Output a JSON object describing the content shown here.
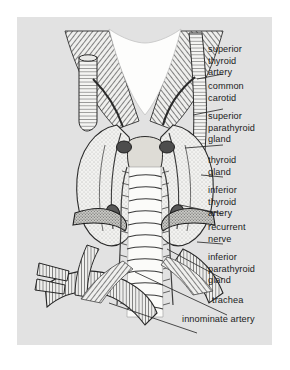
{
  "figure": {
    "kind": "anatomical-illustration",
    "style": "engraving with hatching and stipple shading",
    "panel_color": "#e2e2e2",
    "ink_color": "#1b1b1b",
    "page_background": "#ffffff"
  },
  "labels": [
    {
      "id": "superior-thyroid-artery",
      "lines": [
        "superior",
        "thyroid",
        "artery"
      ],
      "x": 208,
      "y": 44,
      "leader": [
        [
          206,
          57
        ],
        [
          180,
          62
        ]
      ]
    },
    {
      "id": "common-carotid",
      "lines": [
        "common",
        "carotid"
      ],
      "x": 208,
      "y": 81,
      "leader": [
        [
          206,
          92
        ],
        [
          176,
          98
        ]
      ]
    },
    {
      "id": "superior-parathyroid-gland",
      "lines": [
        "superior",
        "parathyroid",
        "gland"
      ],
      "x": 208,
      "y": 111,
      "leader": [
        [
          206,
          128
        ],
        [
          168,
          131
        ]
      ]
    },
    {
      "id": "thyroid-gland",
      "lines": [
        "thyroid",
        "gland"
      ],
      "x": 208,
      "y": 155,
      "leader": [
        [
          206,
          160
        ],
        [
          184,
          158
        ]
      ]
    },
    {
      "id": "inferior-thyroid-artery",
      "lines": [
        "inferior",
        "thyroid",
        "artery"
      ],
      "x": 208,
      "y": 185,
      "leader": [
        [
          206,
          197
        ],
        [
          163,
          188
        ]
      ]
    },
    {
      "id": "recurrent-nerve",
      "lines": [
        "recurrent",
        "nerve"
      ],
      "x": 208,
      "y": 222,
      "leader": [
        [
          206,
          227
        ],
        [
          180,
          225
        ]
      ]
    },
    {
      "id": "inferior-parathyroid-gland",
      "lines": [
        "inferior",
        "parathyroid",
        "gland"
      ],
      "x": 208,
      "y": 252,
      "leader": [
        [
          206,
          262
        ],
        [
          150,
          232
        ]
      ]
    },
    {
      "id": "trachea",
      "lines": [
        "trachea"
      ],
      "x": 212,
      "y": 295,
      "leader": [
        [
          210,
          298
        ],
        [
          118,
          255
        ]
      ]
    },
    {
      "id": "innominate-artery",
      "lines": [
        "innominate artery"
      ],
      "x": 182,
      "y": 314,
      "leader": [
        [
          180,
          316
        ],
        [
          92,
          286
        ]
      ]
    }
  ]
}
